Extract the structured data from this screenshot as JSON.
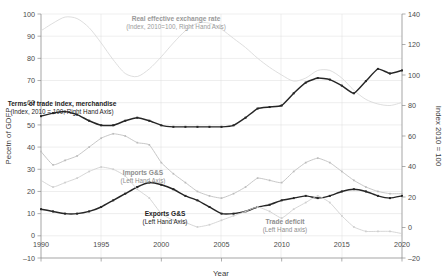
{
  "chart_data": {
    "type": "line",
    "title": "",
    "xlabel": "Year",
    "ylabel_left": "Pecetn of GDFP",
    "ylabel_right": "Index 2010 = 100",
    "xlim": [
      1990,
      2020
    ],
    "ylim_left": [
      -10,
      100
    ],
    "ylim_right": [
      -20,
      140
    ],
    "grid": true,
    "legend_position": "inline-annotations",
    "xticks": [
      "1990",
      "1995",
      "2000",
      "2005",
      "2010",
      "2015",
      "2020"
    ],
    "yticks_left": [
      "-10",
      "0",
      "10",
      "20",
      "30",
      "40",
      "50",
      "60",
      "70",
      "80",
      "90",
      "100"
    ],
    "yticks_right": [
      "-20",
      "0",
      "20",
      "40",
      "60",
      "80",
      "100",
      "120",
      "140"
    ],
    "x": [
      1990,
      1991,
      1992,
      1993,
      1994,
      1995,
      1996,
      1997,
      1998,
      1999,
      2000,
      2001,
      2002,
      2003,
      2004,
      2005,
      2006,
      2007,
      2008,
      2009,
      2010,
      2011,
      2012,
      2013,
      2014,
      2015,
      2016,
      2017,
      2018,
      2019,
      2020
    ],
    "series": [
      {
        "name": "Real effective exchange rate",
        "sublabel": "(Index, 2010=100, Right Hand Axis)",
        "axis": "right",
        "color": "#d8d8d8",
        "markers": false,
        "values": [
          129,
          134,
          138,
          137,
          131,
          121,
          110,
          101,
          99,
          104,
          112,
          121,
          129,
          134,
          134,
          130,
          124,
          118,
          111,
          105,
          100,
          96,
          98,
          103,
          103,
          98,
          90,
          84,
          81,
          80,
          82
        ]
      },
      {
        "name": "Terms of trade index, merchandise",
        "sublabel": "(Index, 2010 = 100, Right Hand Axis)",
        "axis": "right",
        "color": "#262626",
        "markers": true,
        "values": [
          73,
          75,
          76,
          74,
          70,
          67,
          67,
          70,
          72,
          70,
          67,
          66,
          66,
          66,
          66,
          66,
          67,
          72,
          78,
          79,
          80,
          88,
          95,
          98,
          97,
          93,
          88,
          96,
          104,
          101,
          103
        ]
      },
      {
        "name": "Imports G&S",
        "sublabel": "(Left Hand Axis)",
        "axis": "left",
        "color": "#bdbdbd",
        "markers": true,
        "values": [
          38,
          32,
          34,
          36,
          40,
          44,
          46,
          45,
          42,
          41,
          33,
          28,
          24,
          20,
          18,
          17,
          19,
          22,
          26,
          25,
          24,
          29,
          33,
          35,
          33,
          29,
          25,
          22,
          20,
          19,
          19
        ]
      },
      {
        "name": "Exports G&S",
        "sublabel": "(Left Hand Axis)",
        "axis": "left",
        "color": "#262626",
        "markers": true,
        "values": [
          12,
          11,
          10,
          10,
          11,
          13,
          16,
          19,
          22,
          24,
          23,
          21,
          18,
          16,
          13,
          10,
          10,
          11,
          13,
          14,
          16,
          17,
          18,
          17,
          18,
          20,
          21,
          20,
          18,
          17,
          18
        ]
      },
      {
        "name": "Trade deficit",
        "sublabel": "(Left Hand axis)",
        "axis": "left",
        "color": "#cfcfcf",
        "markers": true,
        "values": [
          25,
          22,
          24,
          26,
          29,
          31,
          30,
          27,
          21,
          17,
          10,
          7,
          6,
          4,
          5,
          7,
          9,
          11,
          13,
          11,
          8,
          12,
          15,
          18,
          15,
          9,
          4,
          2,
          2,
          2,
          1
        ]
      }
    ],
    "annotations": [
      {
        "label": "Real effective exchange rate",
        "sublabel": "(Index, 2010=100, Right Hand Axis)",
        "x": 176,
        "y": 21,
        "tone": "light"
      },
      {
        "label": "Terms of trade index, merchandise",
        "sublabel": "(Index, 2010 = 100, Right Hand Axis)",
        "x": 62,
        "y": 106,
        "tone": "dark"
      },
      {
        "label": "Imports G&S",
        "sublabel": "(Left Hand Axis)",
        "x": 143,
        "y": 175,
        "tone": "mid"
      },
      {
        "label": "Exports G&S",
        "sublabel": "(Left Hand Axis)",
        "x": 165,
        "y": 216,
        "tone": "dark"
      },
      {
        "label": "Trade deficit",
        "sublabel": "(Left Hand axis)",
        "x": 285,
        "y": 224,
        "tone": "mid"
      }
    ]
  }
}
